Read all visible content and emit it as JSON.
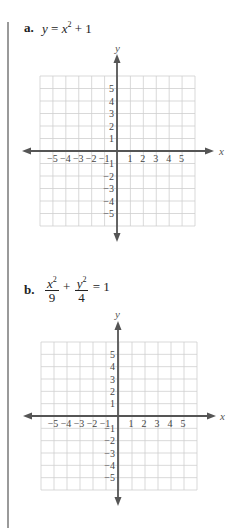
{
  "problems": [
    {
      "label": "a.",
      "equation": {
        "lhs": "y",
        "eq": "=",
        "base": "x",
        "exp": "2",
        "plus": "+",
        "const": "1"
      },
      "graph": {
        "x_label": "x",
        "y_label": "y"
      }
    },
    {
      "label": "b.",
      "equation": {
        "num1": "x",
        "exp1": "2",
        "den1": "9",
        "plus": "+",
        "num2": "y",
        "exp2": "2",
        "den2": "4",
        "eq": "=",
        "rhs": "1"
      },
      "graph": {
        "x_label": "x",
        "y_label": "y"
      }
    }
  ],
  "axis_ticks": {
    "x": [
      "−5",
      "−4",
      "−3",
      "−2",
      "−1",
      "1",
      "2",
      "3",
      "4",
      "5"
    ],
    "y_pos": [
      "5",
      "4",
      "3",
      "2",
      "1"
    ],
    "y_neg": [
      "−1",
      "−2",
      "−3",
      "−4",
      "−5"
    ]
  },
  "colors": {
    "grid": "#cccccc",
    "axis": "#555555",
    "rule": "#9a9a9a"
  }
}
